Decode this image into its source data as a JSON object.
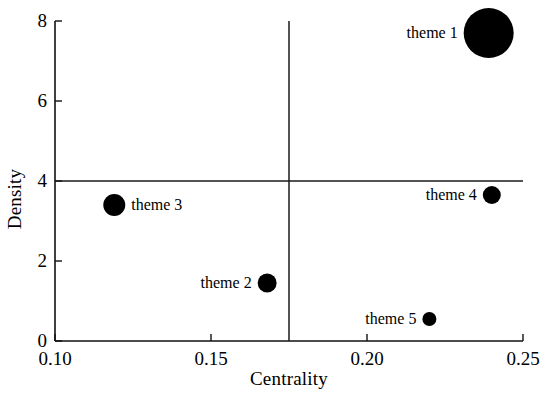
{
  "chart_data": {
    "type": "scatter",
    "title": "",
    "xlabel": "Centrality",
    "ylabel": "Density",
    "xlim": [
      0.1,
      0.25
    ],
    "ylim": [
      0,
      8
    ],
    "xticks": [
      "0.10",
      "0.15",
      "0.20",
      "0.25"
    ],
    "xtick_values": [
      0.1,
      0.15,
      0.2,
      0.25
    ],
    "yticks": [
      "0",
      "2",
      "4",
      "6",
      "8"
    ],
    "ytick_values": [
      0,
      2,
      4,
      6,
      8
    ],
    "grid": false,
    "legend": "none",
    "reference_lines": {
      "vertical_x": 0.175,
      "horizontal_y": 4
    },
    "points": [
      {
        "label": "theme 1",
        "x": 0.239,
        "y": 7.7,
        "size_px": 25,
        "label_side": "left",
        "color": "#000000"
      },
      {
        "label": "theme 2",
        "x": 0.168,
        "y": 1.45,
        "size_px": 9.5,
        "label_side": "left",
        "color": "#000000"
      },
      {
        "label": "theme 3",
        "x": 0.119,
        "y": 3.4,
        "size_px": 11,
        "label_side": "right",
        "color": "#000000"
      },
      {
        "label": "theme 4",
        "x": 0.24,
        "y": 3.65,
        "size_px": 9,
        "label_side": "left",
        "color": "#000000"
      },
      {
        "label": "theme 5",
        "x": 0.22,
        "y": 0.55,
        "size_px": 7,
        "label_side": "left",
        "color": "#000000"
      }
    ]
  }
}
